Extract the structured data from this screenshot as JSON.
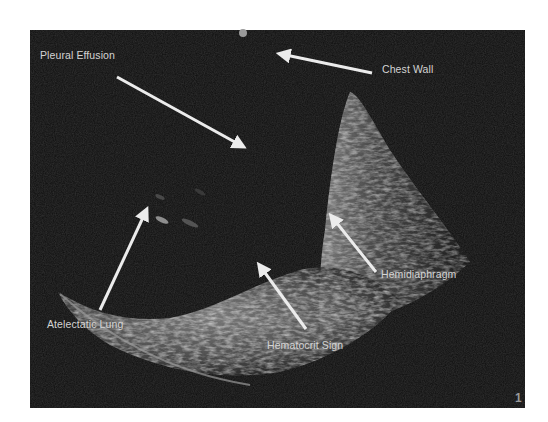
{
  "image": {
    "type": "lung ultrasound",
    "background_color": "#ffffff",
    "panel_color": "#0d0d0d"
  },
  "annotations": [
    {
      "id": "pleural-effusion",
      "label": "Pleural Effusion"
    },
    {
      "id": "chest-wall",
      "label": "Chest Wall"
    },
    {
      "id": "atelectatic-lung",
      "label": "Atelectatic Lung"
    },
    {
      "id": "hematocrit-sign",
      "label": "Hematocrit Sign"
    },
    {
      "id": "hemidiaphragm",
      "label": "Hemidiaphragm"
    }
  ],
  "slide_number": "1"
}
